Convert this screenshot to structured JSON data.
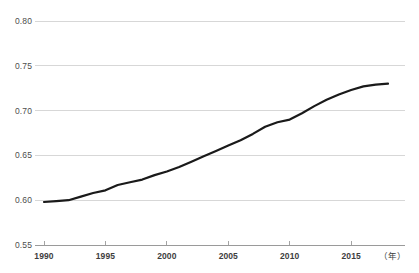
{
  "chart_data": {
    "type": "line",
    "title": "",
    "subtitle": "",
    "xlabel": "（年）",
    "ylabel": "",
    "xlim": [
      1990,
      2018
    ],
    "ylim": [
      0.55,
      0.8
    ],
    "grid": "horizontal",
    "legend": "none",
    "x_ticks": [
      "1990",
      "1995",
      "2000",
      "2005",
      "2010",
      "2015"
    ],
    "x_tick_values": [
      1990,
      1995,
      2000,
      2005,
      2010,
      2015
    ],
    "y_ticks": [
      "0.55",
      "0.60",
      "0.65",
      "0.70",
      "0.75",
      "0.80"
    ],
    "y_tick_values": [
      0.55,
      0.6,
      0.65,
      0.7,
      0.75,
      0.8
    ],
    "series": [
      {
        "name": "",
        "color": "#1a1a1a",
        "x": [
          1990,
          1991,
          1992,
          1993,
          1994,
          1995,
          1996,
          1997,
          1998,
          1999,
          2000,
          2001,
          2002,
          2003,
          2004,
          2005,
          2006,
          2007,
          2008,
          2009,
          2010,
          2011,
          2012,
          2013,
          2014,
          2015,
          2016,
          2017,
          2018
        ],
        "values": [
          0.598,
          0.599,
          0.6,
          0.604,
          0.608,
          0.611,
          0.617,
          0.62,
          0.623,
          0.628,
          0.632,
          0.637,
          0.643,
          0.649,
          0.655,
          0.661,
          0.667,
          0.674,
          0.682,
          0.687,
          0.69,
          0.697,
          0.705,
          0.712,
          0.718,
          0.723,
          0.727,
          0.729,
          0.73
        ]
      }
    ],
    "annotations": []
  },
  "axis_style": {
    "grid_color": "#d3d3d3",
    "axis_color": "#9a9a9a",
    "tick_color": "#9a9a9a",
    "line_color": "#1a1a1a",
    "background": "#ffffff"
  }
}
